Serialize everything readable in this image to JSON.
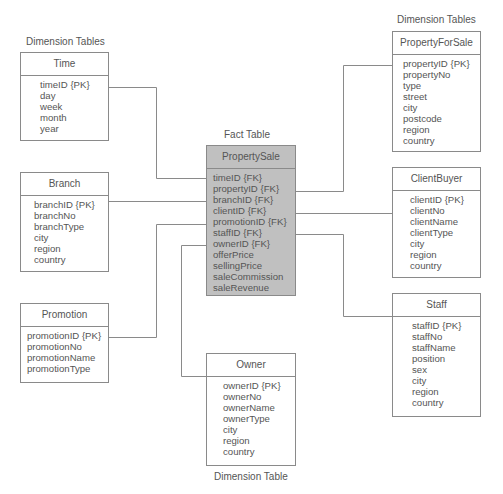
{
  "labels": {
    "dim_left": "Dimension Tables",
    "dim_right": "Dimension Tables",
    "fact": "Fact Table",
    "dim_bottom": "Dimension Table"
  },
  "entities": {
    "time": {
      "name": "Time",
      "attributes": [
        "timeID {PK}",
        "day",
        "week",
        "month",
        "year"
      ]
    },
    "branch": {
      "name": "Branch",
      "attributes": [
        "branchID {PK}",
        "branchNo",
        "branchType",
        "city",
        "region",
        "country"
      ]
    },
    "promotion": {
      "name": "Promotion",
      "attributes": [
        "promotionID {PK}",
        "promotionNo",
        "promotionName",
        "promotionType"
      ]
    },
    "property_sale": {
      "name": "PropertySale",
      "attributes": [
        "timeID {FK}",
        "propertyID {FK}",
        "branchID {FK}",
        "clientID {FK}",
        "promotionID {FK}",
        "staffID {FK}",
        "ownerID {FK}",
        "offerPrice",
        "sellingPrice",
        "saleCommission",
        "saleRevenue"
      ]
    },
    "owner": {
      "name": "Owner",
      "attributes": [
        "ownerID {PK}",
        "ownerNo",
        "ownerName",
        "ownerType",
        "city",
        "region",
        "country"
      ]
    },
    "property_for_sale": {
      "name": "PropertyForSale",
      "attributes": [
        "propertyID {PK}",
        "propertyNo",
        "type",
        "street",
        "city",
        "postcode",
        "region",
        "country"
      ]
    },
    "client_buyer": {
      "name": "ClientBuyer",
      "attributes": [
        "clientID {PK}",
        "clientNo",
        "clientName",
        "clientType",
        "city",
        "region",
        "country"
      ]
    },
    "staff": {
      "name": "Staff",
      "attributes": [
        "staffID {PK}",
        "staffNo",
        "staffName",
        "position",
        "sex",
        "city",
        "region",
        "country"
      ]
    }
  },
  "colors": {
    "fact_fill": "#c0c0c0",
    "line": "#8a8a8a",
    "text": "#555555"
  }
}
